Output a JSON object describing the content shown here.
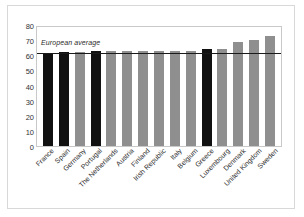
{
  "chart_data": {
    "type": "bar",
    "title": "",
    "xlabel": "",
    "ylabel": "",
    "ylim": [
      0,
      80
    ],
    "yticks": [
      80,
      70,
      60,
      50,
      40,
      30,
      20,
      10,
      0
    ],
    "grid": false,
    "legend_position": "inline-annotation",
    "categories": [
      "France",
      "Spain",
      "Germany",
      "Portugal",
      "The Netherlands",
      "Austria",
      "Finland",
      "Irish Republic",
      "Italy",
      "Belgium",
      "Greece",
      "Luxembourg",
      "Denmark",
      "United Kingdom",
      "Sweden"
    ],
    "values": [
      61,
      62,
      62,
      63,
      63,
      63,
      63,
      63,
      63,
      63,
      64,
      64,
      69,
      70,
      73
    ],
    "bar_colors": [
      "#111111",
      "#111111",
      "#8f8f8f",
      "#111111",
      "#8f8f8f",
      "#8f8f8f",
      "#8f8f8f",
      "#8f8f8f",
      "#8f8f8f",
      "#8f8f8f",
      "#111111",
      "#8f8f8f",
      "#8f8f8f",
      "#8f8f8f",
      "#8f8f8f"
    ],
    "annotations": [
      {
        "name": "european-average",
        "label": "European average",
        "value": 62.5,
        "style": "horizontal-line",
        "color": "#1a1a1a"
      }
    ],
    "colors": {
      "highlight": "#111111",
      "standard": "#8f8f8f",
      "average_line": "#1a1a1a",
      "axis": "#c9c9c9",
      "background": "#ffffff"
    }
  }
}
